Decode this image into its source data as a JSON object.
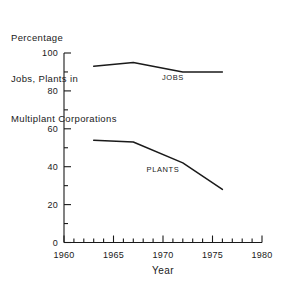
{
  "chart_data": {
    "type": "line",
    "title": "Percentage Jobs, Plants in Multiplant Corporations",
    "title_lines": [
      "Percentage",
      "Jobs, Plants in",
      "Multiplant Corporations"
    ],
    "xlabel": "Year",
    "ylabel": "",
    "xlim": [
      1960,
      1980
    ],
    "ylim": [
      0,
      100
    ],
    "grid": false,
    "legend_position": "inline-labels",
    "x_ticks": [
      1960,
      1965,
      1970,
      1975,
      1980
    ],
    "x_tick_labels": [
      "1960",
      "1965",
      "1970",
      "1975",
      "1980"
    ],
    "x_minor_step": 1,
    "y_ticks": [
      0,
      20,
      40,
      60,
      80,
      100
    ],
    "y_tick_labels": [
      "0",
      "20",
      "40",
      "60",
      "80",
      "100"
    ],
    "y_minor_step": 10,
    "series": [
      {
        "name": "JOBS",
        "label": "JOBS",
        "color": "#1a1a1a",
        "x": [
          1963,
          1967,
          1972,
          1976
        ],
        "values": [
          93,
          95,
          90,
          90
        ]
      },
      {
        "name": "PLANTS",
        "label": "PLANTS",
        "color": "#1a1a1a",
        "x": [
          1963,
          1967,
          1972,
          1976
        ],
        "values": [
          54,
          53,
          42,
          28
        ]
      }
    ],
    "annotations": [
      {
        "text": "JOBS",
        "x": 1971,
        "y": 86
      },
      {
        "text": "PLANTS",
        "x": 1970,
        "y": 37
      }
    ]
  }
}
